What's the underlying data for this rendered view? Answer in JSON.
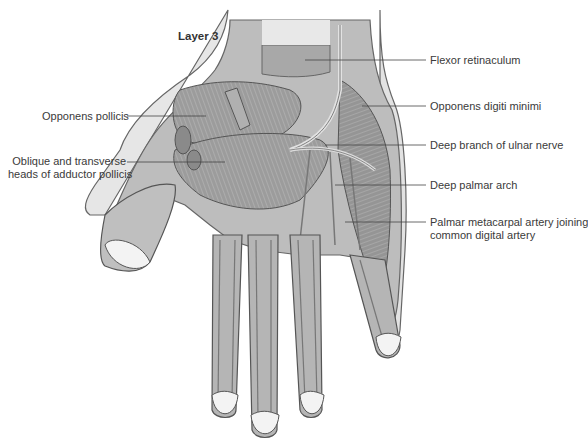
{
  "figure": {
    "title": "Layer 3",
    "colors": {
      "skin_outline": "#5a5a5a",
      "skin_fill": "#f0f0f0",
      "muscle": "#9a9a9a",
      "muscle_dark": "#7a7a7a",
      "tendon": "#d8d8d8",
      "nail": "#f4f4f4",
      "label_text": "#3a3a3a"
    }
  },
  "labels": {
    "left": [
      {
        "text": "Opponens pollicis"
      },
      {
        "line1": "Oblique and transverse",
        "line2": "heads of adductor pollicis"
      }
    ],
    "right": [
      {
        "text": "Flexor retinaculum"
      },
      {
        "text": "Opponens digiti minimi"
      },
      {
        "text": "Deep branch of ulnar nerve"
      },
      {
        "text": "Deep palmar arch"
      },
      {
        "line1": "Palmar metacarpal artery joining",
        "line2": "common digital artery"
      }
    ]
  }
}
